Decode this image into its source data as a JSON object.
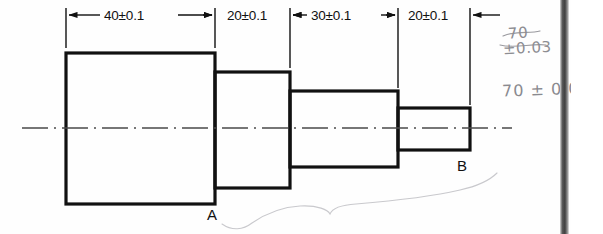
{
  "document": {
    "type": "engineering-drawing",
    "title": "Stepped shaft dimension drawing"
  },
  "dimensions": [
    {
      "id": "dim-40",
      "label": "40±0.1",
      "nominal": 40,
      "tolerance": 0.1,
      "x_start": 66,
      "x_end": 215,
      "text_x": 104,
      "text_y": 8
    },
    {
      "id": "dim-20-a",
      "label": "20±0.1",
      "nominal": 20,
      "tolerance": 0.1,
      "x_start": 215,
      "x_end": 290,
      "text_x": 227,
      "text_y": 8
    },
    {
      "id": "dim-30",
      "label": "30±0.1",
      "nominal": 30,
      "tolerance": 0.1,
      "x_start": 290,
      "x_end": 398,
      "text_x": 311,
      "text_y": 8
    },
    {
      "id": "dim-20-b",
      "label": "20±0.1",
      "nominal": 20,
      "tolerance": 0.1,
      "x_start": 398,
      "x_end": 470,
      "text_x": 408,
      "text_y": 8
    }
  ],
  "datums": [
    {
      "id": "datum-a",
      "label": "A",
      "x": 207,
      "y": 206
    },
    {
      "id": "datum-b",
      "label": "B",
      "x": 457,
      "y": 157
    }
  ],
  "annotations": [
    {
      "id": "annot-struck-value",
      "text": "70",
      "x": 508,
      "y": 24,
      "struck": true
    },
    {
      "id": "annot-struck-tolerance",
      "text": "±0.03",
      "x": 503,
      "y": 39,
      "struck": true
    },
    {
      "id": "annot-corrected",
      "text": "70 ± 0.03",
      "x": 502,
      "y": 80,
      "struck": false
    }
  ],
  "geometry": {
    "steps": [
      {
        "id": "step-1",
        "x": 66,
        "y": 53,
        "width": 149,
        "height": 151
      },
      {
        "id": "step-2",
        "x": 215,
        "y": 72,
        "width": 75,
        "height": 116
      },
      {
        "id": "step-3",
        "x": 290,
        "y": 91,
        "width": 108,
        "height": 76
      },
      {
        "id": "step-4",
        "x": 398,
        "y": 108,
        "width": 72,
        "height": 42
      }
    ],
    "centerline": {
      "y": 128,
      "x_start": 22,
      "x_end": 512
    },
    "dimension_line_y": 15,
    "extension_line_top": 8,
    "extension_line_bottom": 48
  },
  "colors": {
    "outline": "#111111",
    "centerline": "#4a4a4a",
    "dimension": "#111111",
    "handwriting": "#8d8d92",
    "page": "#ffffff",
    "spine": "#3f3f3f"
  }
}
